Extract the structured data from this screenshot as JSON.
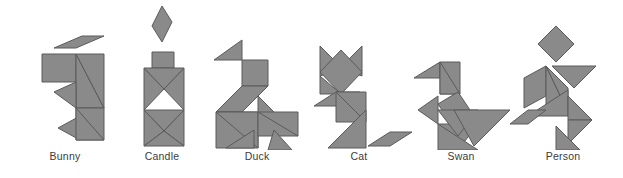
{
  "canvas": {
    "width": 623,
    "height": 178,
    "background": "#ffffff"
  },
  "style": {
    "piece_fill": "#8a8a8a",
    "piece_stroke": "#5a5a5a",
    "label_color": "#3b3b3b"
  },
  "figures": [
    {
      "id": "bunny",
      "label": "Bunny",
      "left": 10,
      "width": 110,
      "label_offset": 22,
      "pieces": [
        {
          "name": "ear-parallelogram",
          "points": "44,48 72,36 94,36 66,48"
        },
        {
          "name": "head-square",
          "points": "32,54 66,54 66,82 32,82"
        },
        {
          "name": "body-large-triangle",
          "points": "66,54 94,108 66,108"
        },
        {
          "name": "back-large-triangle",
          "points": "66,54 94,108 94,54"
        },
        {
          "name": "chest-small-triangle",
          "points": "44,92 66,82 66,108"
        },
        {
          "name": "haunch-square",
          "points": "66,108 94,108 94,140 66,140"
        },
        {
          "name": "foot-triangle",
          "points": "48,128 70,116 70,140"
        },
        {
          "name": "leg-triangle",
          "points": "66,108 94,140 66,140"
        }
      ]
    },
    {
      "id": "candle",
      "label": "Candle",
      "left": 112,
      "width": 100,
      "label_offset": 22,
      "pieces": [
        {
          "name": "flame-diamond",
          "points": "50,6 60,22 50,42 40,26"
        },
        {
          "name": "wick-rectangle",
          "points": "40,52 62,52 62,68 40,68"
        },
        {
          "name": "body-left-triangle",
          "points": "32,68 32,110 52,89"
        },
        {
          "name": "body-right-triangle",
          "points": "72,68 72,110 52,89"
        },
        {
          "name": "body-top-triangle",
          "points": "32,68 72,68 52,89"
        },
        {
          "name": "body-lower-triangle",
          "points": "32,110 72,110 52,131"
        },
        {
          "name": "base-left-triangle",
          "points": "32,110 32,146 52,131"
        },
        {
          "name": "base-right-triangle",
          "points": "72,110 72,146 52,131"
        },
        {
          "name": "base-bottom-triangle",
          "points": "32,146 72,146 52,131"
        }
      ]
    },
    {
      "id": "duck",
      "label": "Duck",
      "left": 202,
      "width": 110,
      "label_offset": 22,
      "pieces": [
        {
          "name": "head-triangle",
          "points": "12,60 40,40 40,60"
        },
        {
          "name": "head-square",
          "points": "40,60 66,60 66,86 40,86"
        },
        {
          "name": "neck-parallelogram",
          "points": "40,86 66,86 40,112 14,112"
        },
        {
          "name": "back-large-triangle",
          "points": "14,112 56,112 56,148 14,148"
        },
        {
          "name": "body-large-triangle",
          "points": "14,112 56,148 56,112"
        },
        {
          "name": "wing-triangle",
          "points": "56,96 96,136 56,136"
        },
        {
          "name": "tail-triangle",
          "points": "56,112 96,136 96,112"
        },
        {
          "name": "leg-left-triangle",
          "points": "24,148 52,130 52,148"
        },
        {
          "name": "leg-right-triangle",
          "points": "72,130 90,150 66,150"
        }
      ]
    },
    {
      "id": "cat",
      "label": "Cat",
      "left": 304,
      "width": 110,
      "label_offset": 22,
      "pieces": [
        {
          "name": "ear-left-triangle",
          "points": "16,46 38,68 16,76"
        },
        {
          "name": "ear-right-triangle",
          "points": "58,46 36,68 58,76"
        },
        {
          "name": "head-square",
          "points": "37,50 58,72 37,94 16,72"
        },
        {
          "name": "neck-triangle",
          "points": "16,76 37,94 16,94"
        },
        {
          "name": "shoulder-parallelogram",
          "points": "10,106 32,92 56,92 34,106"
        },
        {
          "name": "body-large-triangle",
          "points": "32,92 62,122 32,122"
        },
        {
          "name": "chest-large-triangle",
          "points": "32,92 62,122 62,92"
        },
        {
          "name": "leg-triangle",
          "points": "62,110 62,148 24,148"
        },
        {
          "name": "tail-parallelogram",
          "points": "64,146 86,132 108,132 86,146"
        }
      ]
    },
    {
      "id": "swan",
      "label": "Swan",
      "left": 406,
      "width": 110,
      "label_offset": 22,
      "pieces": [
        {
          "name": "beak-triangle",
          "points": "8,78 34,62 34,78"
        },
        {
          "name": "head-parallelogram",
          "points": "34,62 54,62 54,94 34,94"
        },
        {
          "name": "neck-triangle",
          "points": "34,62 54,94 34,94"
        },
        {
          "name": "neck-square",
          "points": "32,104 52,92 64,110 44,122"
        },
        {
          "name": "breast-triangle",
          "points": "12,110 32,96 32,124"
        },
        {
          "name": "body-large-triangle",
          "points": "32,124 72,124 52,150"
        },
        {
          "name": "back-large-triangle",
          "points": "32,110 72,110 52,136"
        },
        {
          "name": "tail-large-triangle",
          "points": "48,110 104,110 68,146"
        },
        {
          "name": "base-triangle",
          "points": "32,124 72,150 32,150"
        }
      ]
    },
    {
      "id": "person",
      "label": "Person",
      "left": 508,
      "width": 110,
      "label_offset": 22,
      "pieces": [
        {
          "name": "head-diamond",
          "points": "48,26 66,44 48,62 30,44"
        },
        {
          "name": "arm-right-triangle",
          "points": "44,66 88,66 66,88"
        },
        {
          "name": "arm-left-parallelogram",
          "points": "16,78 38,66 38,96 16,108"
        },
        {
          "name": "torso-left-triangle",
          "points": "38,66 38,112 60,112"
        },
        {
          "name": "torso-right-triangle",
          "points": "38,66 60,88 60,112"
        },
        {
          "name": "hip-triangle",
          "points": "20,116 60,116 60,90"
        },
        {
          "name": "leg-upper-triangle",
          "points": "60,96 84,120 60,120"
        },
        {
          "name": "leg-lower-triangle",
          "points": "60,120 84,120 60,144"
        },
        {
          "name": "foot-left-parallelogram",
          "points": "2,124 20,110 38,110 20,124"
        },
        {
          "name": "foot-right-triangle",
          "points": "48,126 72,150 48,150"
        }
      ]
    }
  ]
}
